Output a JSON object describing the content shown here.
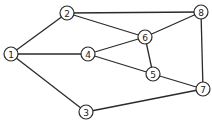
{
  "graph": {
    "node_radius": 7,
    "nodes": [
      {
        "id": "1",
        "label": "1",
        "x": 11,
        "y": 54
      },
      {
        "id": "2",
        "label": "2",
        "x": 67,
        "y": 13
      },
      {
        "id": "3",
        "label": "3",
        "x": 86,
        "y": 112
      },
      {
        "id": "4",
        "label": "4",
        "x": 88,
        "y": 54
      },
      {
        "id": "5",
        "label": "5",
        "x": 153,
        "y": 74
      },
      {
        "id": "6",
        "label": "6",
        "x": 145,
        "y": 37
      },
      {
        "id": "7",
        "label": "7",
        "x": 203,
        "y": 89
      },
      {
        "id": "8",
        "label": "8",
        "x": 201,
        "y": 12
      }
    ],
    "edges": [
      [
        "1",
        "2"
      ],
      [
        "1",
        "4"
      ],
      [
        "1",
        "3"
      ],
      [
        "2",
        "8"
      ],
      [
        "2",
        "6"
      ],
      [
        "4",
        "6"
      ],
      [
        "4",
        "5"
      ],
      [
        "6",
        "8"
      ],
      [
        "6",
        "5"
      ],
      [
        "8",
        "7"
      ],
      [
        "5",
        "7"
      ],
      [
        "3",
        "7"
      ]
    ]
  }
}
